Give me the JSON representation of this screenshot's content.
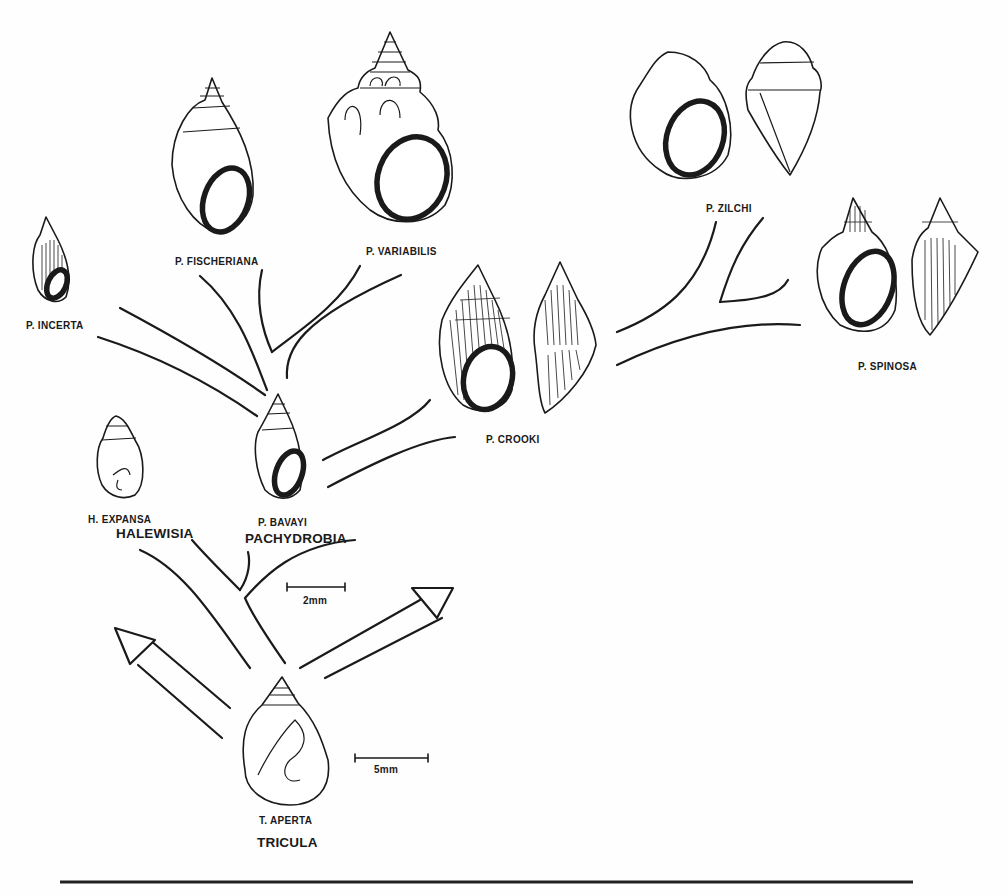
{
  "figure": {
    "species": [
      {
        "id": "p_fischeriana",
        "label": "P. FISCHERIANA"
      },
      {
        "id": "p_variabilis",
        "label": "P. VARIABILIS"
      },
      {
        "id": "p_zilchi",
        "label": "P. ZILCHI"
      },
      {
        "id": "p_incerta",
        "label": "P. INCERTA"
      },
      {
        "id": "p_spinosa",
        "label": "P. SPINOSA"
      },
      {
        "id": "p_crooki",
        "label": "P. CROOKI"
      },
      {
        "id": "h_expansa",
        "label": "H. EXPANSA"
      },
      {
        "id": "p_bavayi",
        "label": "P. BAVAYI"
      },
      {
        "id": "t_aperta",
        "label": "T.  APERTA"
      }
    ],
    "genera": [
      {
        "id": "halewisia",
        "label": "HALEWISIA"
      },
      {
        "id": "pachydrobia",
        "label": "PACHYDROBIA"
      },
      {
        "id": "tricula",
        "label": "TRICULA"
      }
    ],
    "scale_bars": [
      {
        "id": "scale_2mm",
        "label": "2mm"
      },
      {
        "id": "scale_5mm",
        "label": "5mm"
      }
    ],
    "colors": {
      "ink": "#1a1a1a",
      "paper": "#fefefe"
    }
  }
}
